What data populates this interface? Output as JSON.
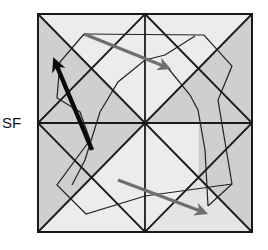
{
  "diagram": {
    "label_left": "SF",
    "colors": {
      "background": "#ffffff",
      "light_fill": "#ececec",
      "dark_fill": "#cfcfcf",
      "grid_line": "#1a1a1a",
      "thick_arrow": "#0a0a0a",
      "gray_arrow": "#6e6e6e"
    },
    "square": {
      "x1": 38,
      "y1": 14,
      "x2": 252,
      "y2": 232
    },
    "center": {
      "x": 145,
      "y": 123
    },
    "polygon_a": "84,34 204,35 232,66 218,100 232,184 208,206 150,184 110,160 86,214 57,185 78,140 90,105 120,70 145,50",
    "polygon_b": "84,34 60,62 50,90 60,110 72,160 100,180 145,196 185,205 208,206 232,184 212,150 205,120 185,95 165,60 145,50",
    "thick_arrow": {
      "x1": 92,
      "y1": 150,
      "x2": 55,
      "y2": 62
    },
    "gray_arrow_top": {
      "x1": 84,
      "y1": 34,
      "x2": 168,
      "y2": 68
    },
    "gray_arrow_bottom": {
      "x1": 118,
      "y1": 180,
      "x2": 204,
      "y2": 213
    }
  }
}
